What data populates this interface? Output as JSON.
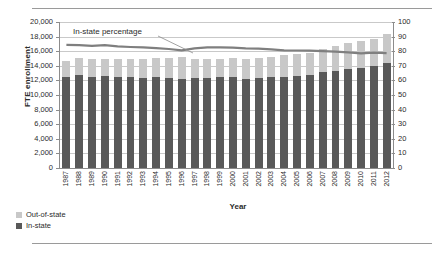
{
  "chart_data": {
    "type": "bar",
    "title": "",
    "xlabel": "Year",
    "ylabel": "FTE enrollment",
    "ylabel_secondary": "Percentage of in-state FTE students",
    "ylim": [
      0,
      20000
    ],
    "ylim_secondary": [
      0,
      100
    ],
    "ytick_step": 2000,
    "ytick_step_secondary": 10,
    "grid": true,
    "stacked": true,
    "legend_position": "bottom-left",
    "annotation": "In-state percentage",
    "categories": [
      "1987",
      "1988",
      "1989",
      "1990",
      "1991",
      "1992",
      "1993",
      "1994",
      "1995",
      "1996",
      "1997",
      "1998",
      "1999",
      "2000",
      "2001",
      "2002",
      "2003",
      "2004",
      "2005",
      "2006",
      "2007",
      "2008",
      "2009",
      "2010",
      "2011",
      "2012"
    ],
    "yticks": [
      "0",
      "2,000",
      "4,000",
      "6,000",
      "8,000",
      "10,000",
      "12,000",
      "14,000",
      "16,000",
      "18,000",
      "20,000"
    ],
    "yticks_secondary": [
      "0",
      "10",
      "20",
      "30",
      "40",
      "50",
      "60",
      "70",
      "80",
      "90",
      "100"
    ],
    "series": [
      {
        "name": "In-state",
        "color": "#595959",
        "axis": "left",
        "values": [
          12400,
          12700,
          12450,
          12550,
          12500,
          12400,
          12350,
          12400,
          12300,
          12250,
          12300,
          12300,
          12400,
          12400,
          12200,
          12350,
          12400,
          12500,
          12600,
          12700,
          13100,
          13350,
          13550,
          13650,
          13950,
          14450
        ]
      },
      {
        "name": "Out-of-state",
        "color": "#c8c8c8",
        "axis": "left",
        "values": [
          2300,
          2400,
          2450,
          2350,
          2500,
          2550,
          2600,
          2700,
          2800,
          2950,
          2700,
          2600,
          2600,
          2650,
          2700,
          2750,
          2850,
          3000,
          3050,
          3100,
          3250,
          3400,
          3550,
          3750,
          3700,
          3900
        ]
      },
      {
        "name": "In-state percentage",
        "color": "#7f7f7f",
        "axis": "right",
        "type": "line",
        "values": [
          84.3,
          84.1,
          83.6,
          84.2,
          83.3,
          82.9,
          82.6,
          82.1,
          81.5,
          80.6,
          82.0,
          82.6,
          82.7,
          82.4,
          81.9,
          81.8,
          81.3,
          80.6,
          80.5,
          80.4,
          80.1,
          79.7,
          79.2,
          78.5,
          79.0,
          78.7
        ]
      }
    ]
  },
  "legend": {
    "items": [
      {
        "label": "Out-of-state",
        "color": "#c8c8c8"
      },
      {
        "label": "In-state",
        "color": "#595959"
      }
    ]
  }
}
